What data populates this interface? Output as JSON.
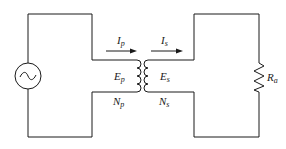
{
  "diagram": {
    "type": "transformer-circuit",
    "colors": {
      "line": "#1a1a1a",
      "background": "#ffffff"
    },
    "source": {
      "icon": "ac-voltage-source-icon",
      "glyph": "~"
    },
    "labels": {
      "primary_current": {
        "main": "I",
        "sub": "p"
      },
      "secondary_current": {
        "main": "I",
        "sub": "s"
      },
      "primary_emf": {
        "main": "E",
        "sub": "p"
      },
      "secondary_emf": {
        "main": "E",
        "sub": "s"
      },
      "primary_turns": {
        "main": "N",
        "sub": "p"
      },
      "secondary_turns": {
        "main": "N",
        "sub": "s"
      },
      "load_resistor": {
        "main": "R",
        "sub": "a"
      }
    }
  }
}
